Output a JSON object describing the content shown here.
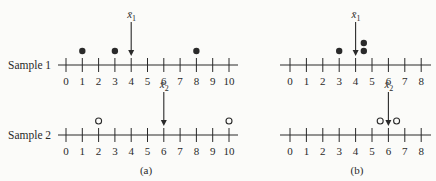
{
  "rows": [
    {
      "label": "Sample 1"
    },
    {
      "label": "Sample 2"
    }
  ],
  "panels": [
    {
      "caption": "(a)",
      "axis": {
        "min": 0,
        "max": 10,
        "ticks": [
          "0",
          "1",
          "2",
          "3",
          "4",
          "5",
          "6",
          "7",
          "8",
          "9",
          "10"
        ]
      },
      "sample1": {
        "points": [
          1,
          3,
          8
        ],
        "marker": "filled",
        "mean": 4,
        "mean_label": "x̄",
        "mean_sub": "1"
      },
      "sample2": {
        "points": [
          2,
          10
        ],
        "marker": "open",
        "mean": 6,
        "mean_label": "x̄",
        "mean_sub": "2"
      }
    },
    {
      "caption": "(b)",
      "axis": {
        "min": 0,
        "max": 8,
        "ticks": [
          "0",
          "1",
          "2",
          "3",
          "4",
          "5",
          "6",
          "7",
          "8"
        ]
      },
      "sample1": {
        "points": [
          3,
          4.5,
          4.5
        ],
        "marker": "filled",
        "mean": 4,
        "mean_label": "x̄",
        "mean_sub": "1"
      },
      "sample2": {
        "points": [
          5.5,
          6.5
        ],
        "marker": "open",
        "mean": 6,
        "mean_label": "x̄",
        "mean_sub": "2"
      }
    }
  ],
  "colors": {
    "ink": "#2a2a2a",
    "background": "#fbfbf9"
  }
}
